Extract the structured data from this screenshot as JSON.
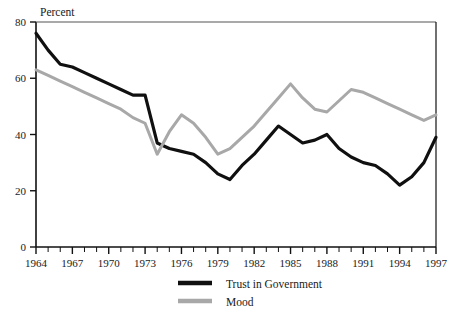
{
  "chart_data": {
    "type": "line",
    "title": "",
    "unit_label": "Percent",
    "xlabel": "",
    "ylabel": "",
    "xlim": [
      1964,
      1997
    ],
    "ylim": [
      0,
      80
    ],
    "yticks": [
      0,
      20,
      40,
      60,
      80
    ],
    "ytick_labels": [
      "0",
      "20",
      "40",
      "60",
      "80"
    ],
    "xticks": [
      1964,
      1965,
      1966,
      1967,
      1968,
      1969,
      1970,
      1971,
      1972,
      1973,
      1974,
      1975,
      1976,
      1977,
      1978,
      1979,
      1980,
      1981,
      1982,
      1983,
      1984,
      1985,
      1986,
      1987,
      1988,
      1989,
      1990,
      1991,
      1992,
      1993,
      1994,
      1995,
      1996,
      1997
    ],
    "xtick_labels_shown": [
      "1964",
      "1967",
      "1970",
      "1973",
      "1976",
      "1979",
      "1982",
      "1985",
      "1988",
      "1991",
      "1994",
      "1997"
    ],
    "grid": false,
    "legend_position": "bottom-center",
    "x": [
      1964,
      1965,
      1966,
      1967,
      1968,
      1969,
      1970,
      1971,
      1972,
      1973,
      1974,
      1975,
      1976,
      1977,
      1978,
      1979,
      1980,
      1981,
      1982,
      1983,
      1984,
      1985,
      1986,
      1987,
      1988,
      1989,
      1990,
      1991,
      1992,
      1993,
      1994,
      1995,
      1996,
      1997
    ],
    "series": [
      {
        "name": "Trust in Government",
        "color": "#101010",
        "values": [
          76,
          70,
          65,
          64,
          62,
          60,
          58,
          56,
          54,
          54,
          37,
          35,
          34,
          33,
          30,
          26,
          24,
          29,
          33,
          38,
          43,
          40,
          37,
          38,
          40,
          35,
          32,
          30,
          29,
          26,
          22,
          25,
          30,
          39
        ]
      },
      {
        "name": "Mood",
        "color": "#a8a8a8",
        "values": [
          63,
          61,
          59,
          57,
          55,
          53,
          51,
          49,
          46,
          44,
          33,
          41,
          47,
          44,
          39,
          33,
          35,
          39,
          43,
          48,
          53,
          58,
          53,
          49,
          48,
          52,
          56,
          55,
          53,
          51,
          49,
          47,
          45,
          47
        ]
      }
    ]
  },
  "legend": {
    "items": [
      {
        "label": "Trust in Government",
        "color": "#101010"
      },
      {
        "label": "Mood",
        "color": "#a8a8a8"
      }
    ]
  },
  "axes": {
    "unit_label": "Percent"
  }
}
